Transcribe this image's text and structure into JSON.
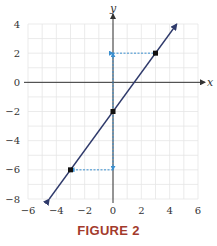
{
  "figure": {
    "caption": "FIGURE 2"
  },
  "colors": {
    "grid": "#e6e6e6",
    "axis": "#333333",
    "line": "#2f3a6b",
    "guide": "#3a8fd0",
    "point": "#111111",
    "caption": "#a33a2c"
  },
  "chart_data": {
    "type": "line",
    "title": "",
    "xlabel": "x",
    "ylabel": "y",
    "xlim": [
      -6,
      6
    ],
    "ylim": [
      -8,
      4
    ],
    "xticks": [
      -6,
      -4,
      -2,
      0,
      2,
      4,
      6
    ],
    "yticks": [
      4,
      2,
      0,
      -2,
      -4,
      -6,
      -8
    ],
    "xtick_labels": [
      "−6",
      "−4",
      "−2",
      "0",
      "2",
      "4",
      "6"
    ],
    "ytick_labels": [
      "4",
      "2",
      "0",
      "−2",
      "−4",
      "−6",
      "−8"
    ],
    "grid": true,
    "grid_minor_step": 1,
    "series": [
      {
        "name": "y = (4/3)x − 2",
        "type": "line",
        "arrows_both_ends": true,
        "x": [
          -4.5,
          4.5
        ],
        "y": [
          -8,
          4
        ]
      }
    ],
    "points": [
      {
        "x": 0,
        "y": -2
      },
      {
        "x": 3,
        "y": 2
      },
      {
        "x": -3,
        "y": -6
      }
    ],
    "guides": [
      {
        "from": [
          0,
          2
        ],
        "to": [
          3,
          2
        ],
        "style": "dashed",
        "arrow": "start"
      },
      {
        "from": [
          0,
          -6
        ],
        "to": [
          -3,
          -6
        ],
        "style": "dashed",
        "arrow": "end"
      },
      {
        "from": [
          0,
          -2
        ],
        "to": [
          0,
          2
        ],
        "style": "dashed",
        "arrow": "end"
      },
      {
        "from": [
          0,
          -2
        ],
        "to": [
          0,
          -6
        ],
        "style": "dashed",
        "arrow": "end"
      }
    ]
  }
}
